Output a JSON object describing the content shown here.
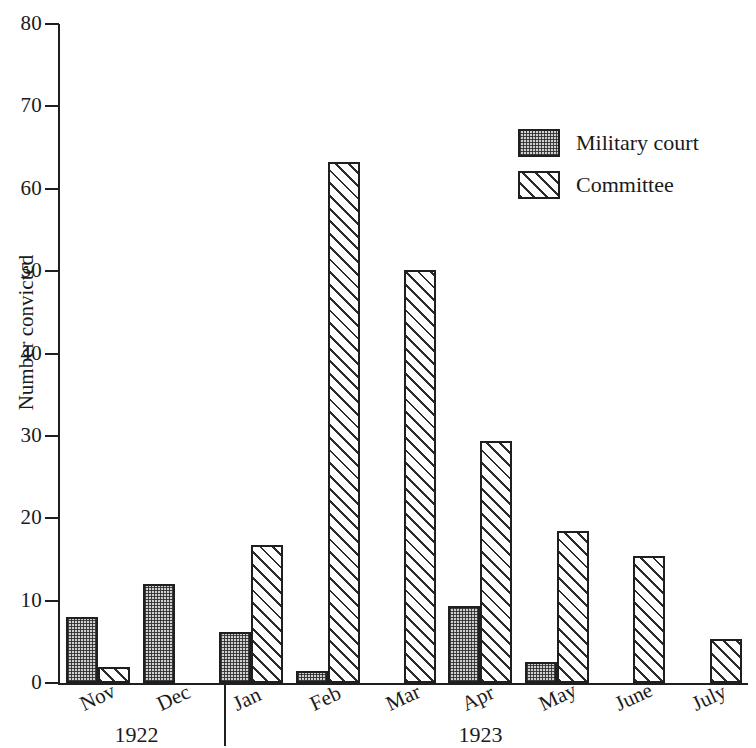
{
  "chart_data": {
    "type": "bar",
    "title": "",
    "subtitle": "",
    "xlabel": "",
    "ylabel": "Number convicted",
    "ylim": [
      0,
      80
    ],
    "yticks": [
      0,
      10,
      20,
      30,
      40,
      50,
      60,
      70,
      80
    ],
    "grid": false,
    "legend_position": "upper right",
    "categories": [
      "Nov",
      "Dec",
      "Jan",
      "Feb",
      "Mar",
      "Apr",
      "May",
      "June",
      "July"
    ],
    "group_labels": [
      "1922",
      "1923"
    ],
    "groups": [
      {
        "label": "1922",
        "categories": [
          "Nov",
          "Dec"
        ]
      },
      {
        "label": "1923",
        "categories": [
          "Jan",
          "Feb",
          "Mar",
          "Apr",
          "May",
          "June",
          "July"
        ]
      }
    ],
    "series": [
      {
        "name": "Military court",
        "fill": "stippled",
        "color": "#cfcfcf",
        "values": [
          8,
          12,
          6.2,
          1.4,
          0,
          9.4,
          2.5,
          0,
          0
        ]
      },
      {
        "name": "Committee",
        "fill": "diagonal-hatch",
        "color": "#ffffff",
        "values": [
          2,
          0,
          16.8,
          63.3,
          50.1,
          29.4,
          18.4,
          15.4,
          5.3
        ]
      }
    ]
  },
  "axis": {
    "y_title": "Number convicted",
    "y_tick_labels": [
      "0",
      "10",
      "20",
      "30",
      "40",
      "50",
      "60",
      "70",
      "80"
    ]
  },
  "legend": {
    "items": [
      {
        "label": "Military court",
        "swatch": "stippled-swatch"
      },
      {
        "label": "Committee",
        "swatch": "hatched-swatch"
      }
    ]
  },
  "x_axis": {
    "months": [
      "Nov",
      "Dec",
      "Jan",
      "Feb",
      "Mar",
      "Apr",
      "May",
      "June",
      "July"
    ],
    "years": [
      "1922",
      "1923"
    ]
  },
  "colors": {
    "axis": "#1f1f1f",
    "military_fill": "#cfcfcf",
    "committee_fill": "#ffffff",
    "ink": "#1a1a1a"
  }
}
